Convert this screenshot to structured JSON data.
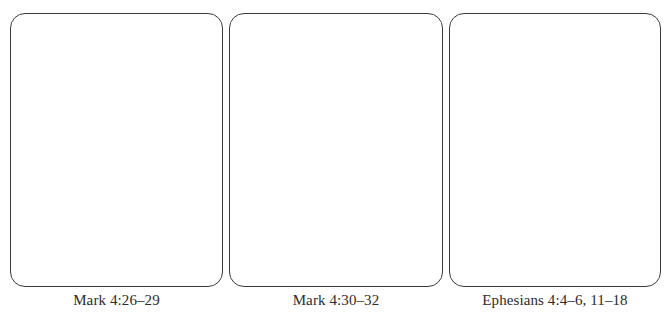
{
  "panels": [
    {
      "caption": "Mark 4:26–29"
    },
    {
      "caption": "Mark 4:30–32"
    },
    {
      "caption": "Ephesians 4:4–6, 11–18"
    }
  ],
  "colors": {
    "border": "#3a3a3a",
    "text": "#2b2b2b",
    "background": "#ffffff"
  }
}
